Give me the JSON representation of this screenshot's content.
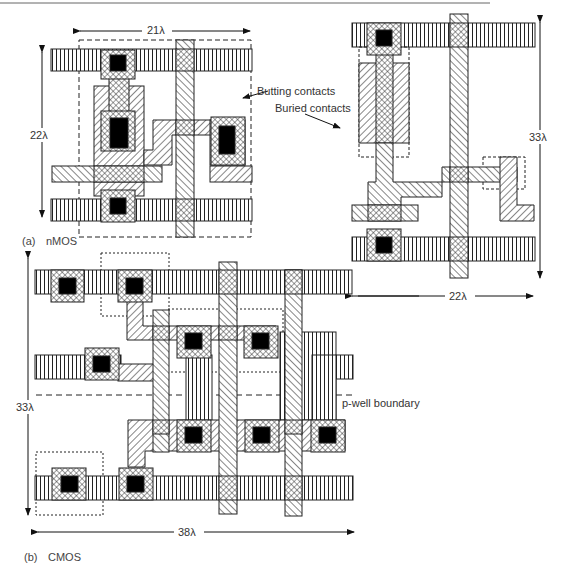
{
  "figure": {
    "panel_a": {
      "caption_prefix": "(a)",
      "caption": "nMOS",
      "left_layout": {
        "width_dim": "21λ",
        "height_dim": "22λ"
      },
      "right_layout": {
        "width_dim": "22λ",
        "height_dim": "33λ"
      },
      "annotations": {
        "butting": "Butting contacts",
        "buried": "Buried contacts"
      }
    },
    "panel_b": {
      "caption_prefix": "(b)",
      "caption": "CMOS",
      "width_dim": "38λ",
      "height_dim": "33λ",
      "pwell_label": "p-well boundary"
    }
  },
  "colors": {
    "ink": "#222222",
    "contact": "#000000",
    "background": "#ffffff"
  }
}
